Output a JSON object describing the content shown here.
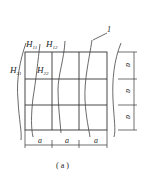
{
  "figure": {
    "caption": "( a )",
    "labels": {
      "h11": {
        "main": "H",
        "sub": "11"
      },
      "h12": {
        "main": "H",
        "sub": "12"
      },
      "h21": {
        "main": "H",
        "sub": "21"
      },
      "h22": {
        "main": "H",
        "sub": "22"
      },
      "marker": "1"
    },
    "dimensions": {
      "horizontal": [
        "a",
        "a",
        "a"
      ],
      "vertical": [
        "a",
        "a",
        "a"
      ]
    },
    "colors": {
      "line": "#333333",
      "background": "#ffffff"
    }
  }
}
